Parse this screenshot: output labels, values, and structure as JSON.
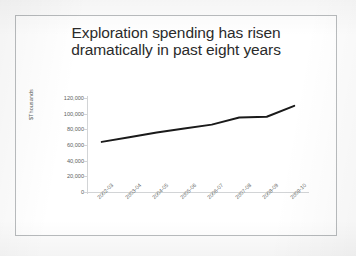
{
  "slide": {
    "background_color": "#ffffff",
    "border_color": "#b9bcbe"
  },
  "chart_data": {
    "type": "line",
    "title": "Exploration spending has risen dramatically in past eight years",
    "title_lines": [
      "Exploration spending has risen",
      "dramatically in past eight years"
    ],
    "categories": [
      "2002-03",
      "2003-04",
      "2004-05",
      "2005-06",
      "2006-07",
      "2007-08",
      "2008-09",
      "2009-10"
    ],
    "values": [
      64000,
      70000,
      76000,
      81000,
      86000,
      95000,
      96000,
      110000
    ],
    "series": [
      {
        "name": "Exploration spending",
        "values": [
          64000,
          70000,
          76000,
          81000,
          86000,
          95000,
          96000,
          110000
        ],
        "color": "#1a1a1a",
        "line_width": 2
      }
    ],
    "xlabel": "",
    "ylabel": "$Thousands",
    "ylim": [
      0,
      120000
    ],
    "ytick_labels": [
      "120,000",
      "100,000",
      "80,000",
      "60,000",
      "40,000",
      "20,000",
      "0"
    ],
    "ytick_values": [
      120000,
      100000,
      80000,
      60000,
      40000,
      20000,
      0
    ],
    "grid": false,
    "legend": false,
    "legend_position": "none",
    "x_tick_label_rotation": -45,
    "axis_color": "#d2d4d6",
    "tick_label_color": "#5d5f61",
    "title_color": "#2b2b2b"
  }
}
